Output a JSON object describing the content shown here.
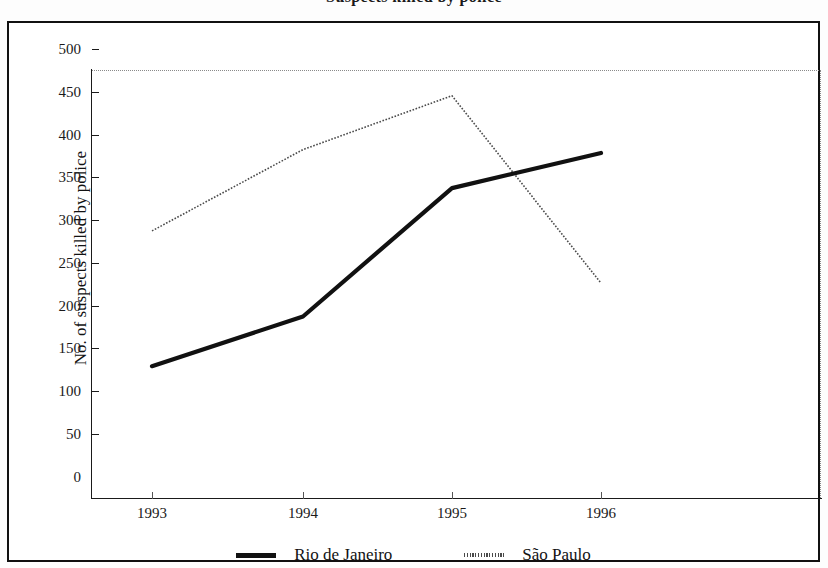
{
  "title": "Suspects killed by police",
  "chart_data": {
    "type": "line",
    "title": "Suspects killed by police",
    "xlabel": "",
    "ylabel": "No. of suspects killed by police",
    "categories": [
      "1993",
      "1994",
      "1995",
      "1996"
    ],
    "x_tick_labels": [
      "1993",
      "1994",
      "1995",
      "1996"
    ],
    "y_tick_labels": [
      "0",
      "50",
      "100",
      "150",
      "200",
      "250",
      "300",
      "350",
      "400",
      "450",
      "500"
    ],
    "y_ticks": [
      0,
      50,
      100,
      150,
      200,
      250,
      300,
      350,
      400,
      450,
      500
    ],
    "ylim": [
      0,
      500
    ],
    "grid": false,
    "legend_position": "bottom",
    "series": [
      {
        "name": "Rio de Janeiro",
        "style": "solid-thick",
        "color": "#111111",
        "values": [
          154,
          212,
          362,
          403
        ]
      },
      {
        "name": "São Paulo",
        "style": "dotted-thin",
        "color": "#4a4a4a",
        "values": [
          312,
          407,
          470,
          251
        ]
      }
    ]
  },
  "legend": {
    "items": [
      {
        "label": "Rio de Janeiro",
        "swatch": "solid-line-swatch"
      },
      {
        "label": "São Paulo",
        "swatch": "dotted-line-swatch"
      }
    ]
  },
  "axes": {
    "y_title": "No. of suspects killed by police"
  },
  "colors": {
    "frame": "#111111",
    "rio": "#111111",
    "saopaulo": "#4a4a4a",
    "dotted_border": "#8a8a8a",
    "background": "#ffffff"
  }
}
